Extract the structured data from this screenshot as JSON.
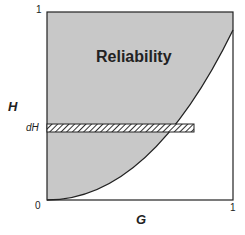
{
  "diagram": {
    "region_label": "Reliability",
    "y_axis_label": "H",
    "x_axis_label": "G",
    "strip_label": "dH",
    "ticks": {
      "origin": "0",
      "x_max": "1",
      "y_max": "1"
    },
    "colors": {
      "fill": "#c8c8c8",
      "stroke": "#222222",
      "background": "#ffffff"
    }
  }
}
